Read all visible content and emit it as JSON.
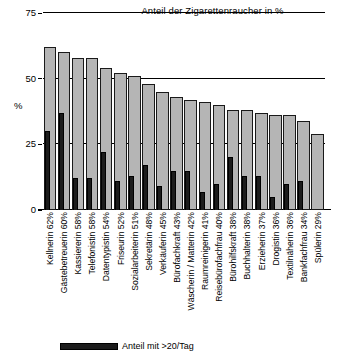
{
  "chart_data": {
    "type": "bar",
    "title": "Anteil der Zigarettenraucher in %",
    "xlabel": "",
    "ylabel": "%",
    "ylim": [
      0,
      75
    ],
    "yticks": [
      0,
      25,
      50,
      75
    ],
    "grid": true,
    "legend_position": "bottom",
    "categories": [
      "Kellnerin 62%",
      "Gästebetreuerin 60%",
      "Kassiererin 58%",
      "Telefonistin 58%",
      "Datentypistin 54%",
      "Friseurin 52%",
      "Sozialarbeiterin 51%",
      "Sekretärin 48%",
      "Verkäuferin 45%",
      "Bürofachkraft 43%",
      "Wäscherin / Matterin 42%",
      "Raumreinigerin 41%",
      "Reisebürofachfrau 40%",
      "Bürohilfskraft 38%",
      "Buchhalterin 38%",
      "Erzieherin 37%",
      "Drogistin 36%",
      "Textilnäherin 36%",
      "Bankfachfrau 34%",
      "Spülerin 29%"
    ],
    "series": [
      {
        "name": "Anteil der Zigarettenraucher in %",
        "color": "#b5b5b5",
        "values": [
          62,
          60,
          58,
          58,
          54,
          52,
          51,
          48,
          45,
          43,
          42,
          41,
          40,
          38,
          38,
          37,
          36,
          36,
          34,
          29
        ]
      },
      {
        "name": "Anteil mit >20/Tag",
        "color": "#1c1c1c",
        "values": [
          30,
          37,
          12,
          12,
          22,
          11,
          13,
          17,
          9,
          15,
          15,
          7,
          10,
          20,
          13,
          13,
          5,
          10,
          11,
          0
        ]
      }
    ]
  },
  "axis": {
    "tick_75": "75",
    "tick_50": "50",
    "tick_25": "25",
    "tick_0": "0",
    "y_name": "%"
  },
  "legend": {
    "heavy_smokers_label": "Anteil mit >20/Tag"
  }
}
